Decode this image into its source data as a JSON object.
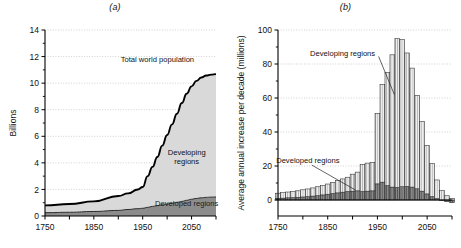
{
  "figure": {
    "panel_a_label": "(a)",
    "panel_b_label": "(b)"
  },
  "chart_data": [
    {
      "id": "panel-a",
      "type": "area",
      "title": "(a)",
      "xlabel": "",
      "ylabel": "Billions",
      "xlim": [
        1750,
        2100
      ],
      "ylim": [
        0,
        14
      ],
      "xticks": [
        1750,
        1800,
        1850,
        1900,
        1950,
        2000,
        2050,
        2100
      ],
      "xticklabels": [
        "1750",
        "",
        "1850",
        "",
        "1950",
        "",
        "2050",
        ""
      ],
      "yticks": [
        0,
        2,
        4,
        6,
        8,
        10,
        12,
        14
      ],
      "yticklabels": [
        "0",
        "2",
        "4",
        "6",
        "8",
        "10",
        "12",
        "14"
      ],
      "grid": true,
      "stacked": true,
      "legend_position": "inline-annotations",
      "annotations": [
        {
          "text": "Total world population",
          "x": 1980,
          "y": 11.6
        },
        {
          "text": "Developing regions",
          "x": 2040,
          "y": 4.6
        },
        {
          "text": "Developed regions",
          "x": 2040,
          "y": 0.75
        }
      ],
      "x": [
        1750,
        1800,
        1850,
        1900,
        1920,
        1940,
        1950,
        1960,
        1970,
        1980,
        1990,
        2000,
        2010,
        2020,
        2030,
        2040,
        2050,
        2060,
        2070,
        2080,
        2090,
        2100
      ],
      "series": [
        {
          "name": "Developed regions",
          "color": "#8c8c8c",
          "values": [
            0.25,
            0.28,
            0.34,
            0.42,
            0.49,
            0.55,
            0.58,
            0.65,
            0.72,
            0.78,
            0.84,
            0.9,
            0.96,
            1.03,
            1.1,
            1.18,
            1.26,
            1.32,
            1.37,
            1.4,
            1.42,
            1.43
          ]
        },
        {
          "name": "Developing regions",
          "color": "#d9d9d9",
          "values": [
            0.55,
            0.62,
            0.76,
            1.08,
            1.21,
            1.45,
            1.6,
            2.35,
            2.98,
            3.66,
            4.46,
            5.2,
            5.94,
            6.67,
            7.4,
            8.02,
            8.5,
            8.85,
            9.05,
            9.17,
            9.22,
            9.25
          ]
        }
      ],
      "total_world_population": [
        0.8,
        0.9,
        1.1,
        1.5,
        1.7,
        2.0,
        2.18,
        3.0,
        3.7,
        4.44,
        5.3,
        6.1,
        6.9,
        7.7,
        8.5,
        9.2,
        9.76,
        10.17,
        10.42,
        10.57,
        10.64,
        10.68
      ]
    },
    {
      "id": "panel-b",
      "type": "bar",
      "title": "(b)",
      "xlabel": "",
      "ylabel": "Average annual increase per decade (millions)",
      "xlim": [
        1750,
        2100
      ],
      "ylim": [
        -8,
        100
      ],
      "xticks": [
        1750,
        1800,
        1850,
        1900,
        1950,
        2000,
        2050,
        2100
      ],
      "xticklabels": [
        "1750",
        "",
        "1850",
        "",
        "1950",
        "",
        "2050",
        ""
      ],
      "yticks": [
        0,
        20,
        40,
        60,
        80,
        100
      ],
      "yticklabels": [
        "0",
        "20",
        "40",
        "60",
        "80",
        "100"
      ],
      "grid": true,
      "stacked": true,
      "legend_position": "inline-annotations",
      "annotations": [
        {
          "text": "Developing regions",
          "x": 1880,
          "y": 85
        },
        {
          "text": "Developed regions",
          "x": 1810,
          "y": 22
        }
      ],
      "categories": [
        1750,
        1760,
        1770,
        1780,
        1790,
        1800,
        1810,
        1820,
        1830,
        1840,
        1850,
        1860,
        1870,
        1880,
        1890,
        1900,
        1910,
        1920,
        1930,
        1940,
        1950,
        1960,
        1970,
        1980,
        1990,
        2000,
        2010,
        2020,
        2030,
        2040,
        2050,
        2060,
        2070,
        2080,
        2090,
        2100
      ],
      "series": [
        {
          "name": "Developed regions",
          "color": "#767676",
          "values": [
            1.0,
            1.1,
            1.3,
            1.4,
            1.6,
            1.8,
            2.0,
            2.3,
            2.6,
            3.0,
            3.4,
            3.8,
            4.2,
            4.6,
            5.0,
            5.2,
            5.4,
            5.0,
            5.2,
            5.4,
            9.5,
            10.5,
            8.5,
            7.6,
            7.4,
            7.8,
            8.0,
            7.6,
            6.6,
            5.2,
            3.6,
            2.0,
            0.8,
            -0.2,
            -1.0,
            -1.6
          ]
        },
        {
          "name": "Developing regions",
          "color": "#e3e3e3",
          "values": [
            3.0,
            3.2,
            3.4,
            3.6,
            3.8,
            4.2,
            4.5,
            4.8,
            5.2,
            5.6,
            6.0,
            6.6,
            7.2,
            7.8,
            8.4,
            10.0,
            11.0,
            16.0,
            16.5,
            16.8,
            41.5,
            57.5,
            66.5,
            77.8,
            87.5,
            86.5,
            78.5,
            70.0,
            55.0,
            41.0,
            28.5,
            19.5,
            11.0,
            5.5,
            2.5,
            1.0
          ]
        }
      ],
      "totals": [
        4.0,
        4.3,
        4.7,
        5.0,
        5.4,
        6.0,
        6.5,
        7.1,
        7.8,
        8.6,
        9.4,
        10.4,
        11.4,
        12.4,
        13.4,
        15.2,
        16.4,
        21.0,
        21.7,
        22.2,
        51.0,
        68.0,
        75.0,
        85.4,
        94.9,
        94.3,
        86.5,
        77.6,
        61.6,
        46.2,
        32.1,
        21.5,
        11.8,
        5.3,
        1.5,
        -0.6
      ]
    }
  ]
}
